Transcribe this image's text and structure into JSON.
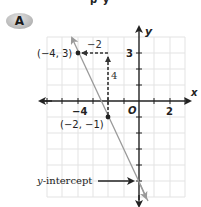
{
  "header": {
    "badge_label": "A",
    "cut_off_text": "p y"
  },
  "graph": {
    "axes": {
      "x_label": "x",
      "y_label": "y",
      "origin_label": "O",
      "x_tick_labels": [
        {
          "value": -4,
          "label": "−4"
        },
        {
          "value": 2,
          "label": "2"
        }
      ],
      "y_tick_labels": [
        {
          "value": 3,
          "label": "3"
        }
      ],
      "x_range": [
        -6,
        3
      ],
      "y_range": [
        -6,
        4
      ]
    },
    "line": {
      "equation": "y = -2x - 5",
      "slope": -2,
      "y_intercept": -5,
      "color": "#9a9a9a"
    },
    "points": [
      {
        "x": -4,
        "y": 3,
        "label": "(−4, 3)"
      },
      {
        "x": -2,
        "y": -1,
        "label": "(−2, −1)"
      }
    ],
    "rise_run": {
      "rise_label": "4",
      "run_label": "−2",
      "color": "#333333"
    },
    "annotation": {
      "label": "y-intercept",
      "italic_part": "y",
      "rest": "-intercept"
    }
  }
}
